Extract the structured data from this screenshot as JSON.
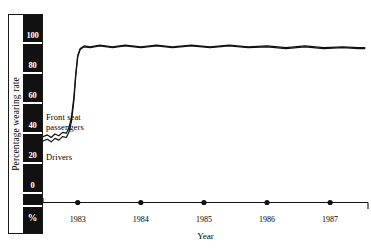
{
  "figure": {
    "title_remnant": "",
    "background": "#ffffff",
    "ink_color": "#111111"
  },
  "yaxis": {
    "title": "Percentage wearing rate",
    "tick_labels": [
      "100",
      "80",
      "60",
      "40",
      "20",
      "0"
    ],
    "unit_label": "%",
    "bar_color": "#111111",
    "label_color": "#ffffff"
  },
  "xaxis": {
    "title": "Year",
    "tick_labels": [
      "1983",
      "1984",
      "1985",
      "1986",
      "1987"
    ],
    "marker": "filled-dot"
  },
  "annotations": {
    "front_seat": "Front seat\npassengers",
    "drivers": "Drivers"
  },
  "chart_data": {
    "type": "line",
    "title": "",
    "xlabel": "Year",
    "ylabel": "Percentage wearing rate",
    "yunit": "%",
    "xlim": [
      1982.45,
      1987.6
    ],
    "ylim": [
      0,
      110
    ],
    "yticks": [
      0,
      20,
      40,
      60,
      80,
      100
    ],
    "xticks": [
      1983,
      1984,
      1985,
      1986,
      1987
    ],
    "grid": false,
    "legend": "inline-annotations",
    "series": [
      {
        "name": "Front seat passengers",
        "points": [
          [
            1982.45,
            39.0
          ],
          [
            1982.52,
            40.0
          ],
          [
            1982.58,
            38.5
          ],
          [
            1982.64,
            40.5
          ],
          [
            1982.7,
            39.5
          ],
          [
            1982.76,
            41.5
          ],
          [
            1982.82,
            41.0
          ],
          [
            1982.86,
            44.0
          ],
          [
            1982.9,
            50.0
          ],
          [
            1982.94,
            62.0
          ],
          [
            1982.97,
            76.0
          ],
          [
            1983.0,
            86.0
          ],
          [
            1983.04,
            90.0
          ],
          [
            1983.1,
            91.5
          ],
          [
            1983.2,
            91.0
          ],
          [
            1983.35,
            92.0
          ],
          [
            1983.55,
            91.0
          ],
          [
            1983.75,
            92.0
          ],
          [
            1984.0,
            91.0
          ],
          [
            1984.25,
            92.0
          ],
          [
            1984.5,
            91.0
          ],
          [
            1984.8,
            92.0
          ],
          [
            1985.1,
            91.0
          ],
          [
            1985.4,
            92.0
          ],
          [
            1985.7,
            91.0
          ],
          [
            1986.0,
            91.5
          ],
          [
            1986.3,
            90.5
          ],
          [
            1986.6,
            91.5
          ],
          [
            1986.9,
            90.5
          ],
          [
            1987.2,
            91.0
          ],
          [
            1987.45,
            90.5
          ],
          [
            1987.55,
            90.5
          ]
        ]
      },
      {
        "name": "Drivers",
        "points": [
          [
            1982.45,
            36.5
          ],
          [
            1982.52,
            37.5
          ],
          [
            1982.58,
            36.0
          ],
          [
            1982.64,
            38.0
          ],
          [
            1982.7,
            37.0
          ],
          [
            1982.76,
            39.0
          ],
          [
            1982.82,
            38.5
          ],
          [
            1982.86,
            41.5
          ],
          [
            1982.9,
            47.5
          ],
          [
            1982.94,
            60.0
          ],
          [
            1982.97,
            74.5
          ],
          [
            1983.0,
            85.0
          ],
          [
            1983.04,
            89.5
          ],
          [
            1983.1,
            91.0
          ],
          [
            1983.2,
            90.5
          ],
          [
            1983.35,
            91.5
          ],
          [
            1983.55,
            90.5
          ],
          [
            1983.75,
            91.5
          ],
          [
            1984.0,
            90.5
          ],
          [
            1984.25,
            91.5
          ],
          [
            1984.5,
            90.5
          ],
          [
            1984.8,
            91.5
          ],
          [
            1985.1,
            90.5
          ],
          [
            1985.4,
            91.5
          ],
          [
            1985.7,
            90.5
          ],
          [
            1986.0,
            91.0
          ],
          [
            1986.3,
            90.0
          ],
          [
            1986.6,
            91.0
          ],
          [
            1986.9,
            90.0
          ],
          [
            1987.2,
            90.5
          ],
          [
            1987.45,
            90.0
          ],
          [
            1987.55,
            90.0
          ]
        ]
      }
    ]
  }
}
